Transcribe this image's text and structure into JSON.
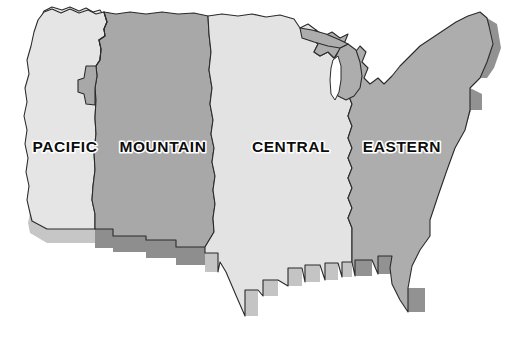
{
  "map": {
    "title": "United States Time Zone Map",
    "background_color": "#ffffff",
    "outline_color": "#2b2b2b",
    "style": "3d-extruded-shaded-relief",
    "label_text_color": "#0d0d0d",
    "label_halo_color": "#ffffff",
    "zones": [
      {
        "id": "pacific",
        "label": "PACIFIC",
        "fill_color": "#e5e5e5",
        "side_face_color": "#c6c6c6",
        "label_x": 65,
        "label_y": 148
      },
      {
        "id": "mountain",
        "label": "MOUNTAIN",
        "fill_color": "#a8a8a8",
        "side_face_color": "#8e8e8e",
        "label_x": 163,
        "label_y": 148
      },
      {
        "id": "central",
        "label": "CENTRAL",
        "fill_color": "#e3e3e3",
        "side_face_color": "#c4c4c4",
        "label_x": 291,
        "label_y": 148
      },
      {
        "id": "eastern",
        "label": "EASTERN",
        "fill_color": "#adadad",
        "side_face_color": "#929292",
        "label_x": 402,
        "label_y": 148
      }
    ],
    "water_bodies": [
      {
        "id": "lake-michigan",
        "fill_color": "#ffffff"
      }
    ]
  }
}
